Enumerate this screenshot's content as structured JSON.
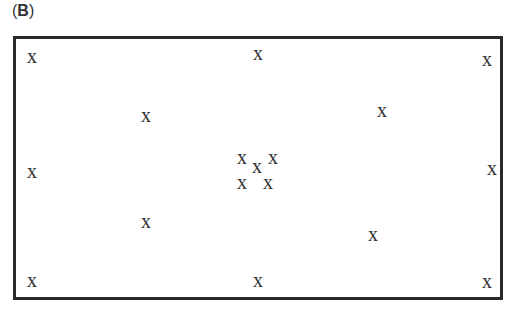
{
  "panel": {
    "label_open": "(",
    "label_letter": "B",
    "label_close": ")"
  },
  "marker_glyph": "x",
  "markers": [
    {
      "x": 32,
      "y": 56
    },
    {
      "x": 258,
      "y": 53
    },
    {
      "x": 487,
      "y": 59
    },
    {
      "x": 146,
      "y": 115
    },
    {
      "x": 382,
      "y": 110
    },
    {
      "x": 32,
      "y": 171
    },
    {
      "x": 492,
      "y": 168
    },
    {
      "x": 242,
      "y": 157
    },
    {
      "x": 257,
      "y": 166
    },
    {
      "x": 273,
      "y": 157
    },
    {
      "x": 242,
      "y": 182
    },
    {
      "x": 268,
      "y": 182
    },
    {
      "x": 146,
      "y": 221
    },
    {
      "x": 373,
      "y": 234
    },
    {
      "x": 32,
      "y": 280
    },
    {
      "x": 258,
      "y": 280
    },
    {
      "x": 487,
      "y": 281
    }
  ]
}
